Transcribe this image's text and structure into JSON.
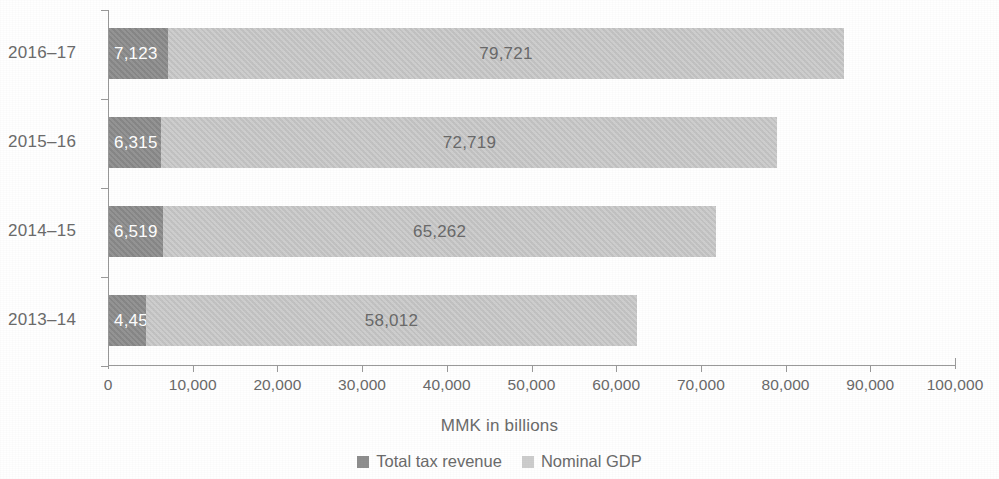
{
  "chart_data": {
    "type": "bar",
    "orientation": "horizontal",
    "stacked": true,
    "title": "",
    "xlabel": "MMK in billions",
    "ylabel": "",
    "categories": [
      "2016–17",
      "2015–16",
      "2014–15",
      "2013–14"
    ],
    "series": [
      {
        "name": "Total tax revenue",
        "color": "#8e8e8e",
        "values": [
          7123,
          6315,
          6519,
          4459
        ],
        "labels": [
          "7,123",
          "6,315",
          "6,519",
          "4,459"
        ]
      },
      {
        "name": "Nominal GDP",
        "color": "#c9c9c9",
        "values": [
          79721,
          72719,
          65262,
          58012
        ],
        "labels": [
          "79,721",
          "72,719",
          "65,262",
          "58,012"
        ]
      }
    ],
    "xlim": [
      0,
      100000
    ],
    "xticks": [
      0,
      10000,
      20000,
      30000,
      40000,
      50000,
      60000,
      70000,
      80000,
      90000,
      100000
    ],
    "xtick_labels": [
      "0",
      "10,000",
      "20,000",
      "30,000",
      "40,000",
      "50,000",
      "60,000",
      "70,000",
      "80,000",
      "90,000",
      "100,000"
    ],
    "grid": false,
    "legend_position": "bottom"
  },
  "axis": {
    "x_title": "MMK in billions"
  },
  "legend": {
    "items": [
      {
        "label": "Total tax revenue",
        "color": "#8e8e8e"
      },
      {
        "label": "Nominal GDP",
        "color": "#cdcdcd"
      }
    ]
  }
}
